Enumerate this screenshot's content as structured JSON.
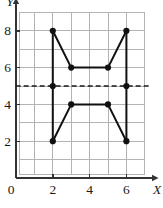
{
  "figure": {
    "title": "",
    "background_color": "#ffffff"
  },
  "axes": {
    "x_axis_label": "X",
    "y_axis_label": "Y",
    "x_ticks": [
      {
        "value": 2,
        "label": "2"
      },
      {
        "value": 4,
        "label": "4"
      },
      {
        "value": 6,
        "label": "6"
      }
    ],
    "y_ticks": [
      {
        "value": 2,
        "label": "2"
      },
      {
        "value": 4,
        "label": "4"
      },
      {
        "value": 6,
        "label": "6"
      },
      {
        "value": 8,
        "label": "8"
      }
    ],
    "origin_label": "0",
    "axis_color": "#333333",
    "grid_color": "#b3b3b3"
  },
  "chart_data": {
    "type": "scatter",
    "title": "",
    "xlabel": "X",
    "ylabel": "Y",
    "xlim": [
      0,
      7.4
    ],
    "ylim": [
      0,
      9.2
    ],
    "grid": true,
    "legend": "none",
    "x_ticks": [
      2,
      4,
      6
    ],
    "y_ticks": [
      2,
      4,
      6,
      8
    ],
    "point_color": "#111111",
    "line_color": "#111111",
    "points": [
      {
        "x": 2,
        "y": 8
      },
      {
        "x": 3,
        "y": 6
      },
      {
        "x": 5,
        "y": 6
      },
      {
        "x": 6,
        "y": 8
      },
      {
        "x": 2,
        "y": 5
      },
      {
        "x": 6,
        "y": 5
      },
      {
        "x": 3,
        "y": 4
      },
      {
        "x": 5,
        "y": 4
      },
      {
        "x": 2,
        "y": 2
      },
      {
        "x": 6,
        "y": 2
      }
    ],
    "polylines": [
      {
        "name": "left-vertical-edge",
        "points": [
          [
            2,
            8
          ],
          [
            2,
            5
          ],
          [
            2,
            2
          ]
        ]
      },
      {
        "name": "right-vertical-edge",
        "points": [
          [
            6,
            8
          ],
          [
            6,
            5
          ],
          [
            6,
            2
          ]
        ]
      },
      {
        "name": "upper-trapezoid-edge",
        "points": [
          [
            2,
            8
          ],
          [
            3,
            6
          ],
          [
            5,
            6
          ],
          [
            6,
            8
          ]
        ]
      },
      {
        "name": "lower-trapezoid-edge",
        "points": [
          [
            2,
            2
          ],
          [
            3,
            4
          ],
          [
            5,
            4
          ],
          [
            6,
            2
          ]
        ]
      }
    ],
    "reference_lines": [
      {
        "name": "line-of-symmetry",
        "orientation": "horizontal",
        "value": 5,
        "style": "dashed",
        "color": "#1a1a1a"
      }
    ]
  }
}
